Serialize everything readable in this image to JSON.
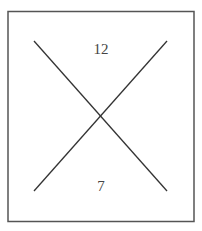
{
  "diagram": {
    "labels": {
      "top": "12",
      "bottom": "7"
    },
    "colors": {
      "border": "#555555",
      "lines": "#333333",
      "text": "#444444"
    }
  }
}
